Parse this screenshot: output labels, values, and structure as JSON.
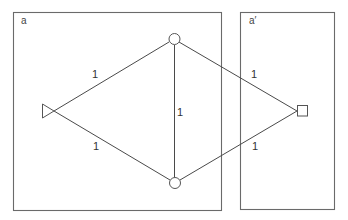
{
  "panels": [
    {
      "label": "a",
      "x": 13,
      "y": 12,
      "w": 208,
      "h": 198
    },
    {
      "label": "a′",
      "x": 240,
      "y": 12,
      "w": 94,
      "h": 198
    }
  ],
  "nodes": {
    "source": {
      "shape": "triangle",
      "x": 48,
      "y": 111
    },
    "top": {
      "shape": "circle",
      "x": 174,
      "y": 39
    },
    "bottom": {
      "shape": "circle",
      "x": 175,
      "y": 183
    },
    "sink": {
      "shape": "square",
      "x": 302,
      "y": 111
    }
  },
  "edges": [
    {
      "from": "source",
      "to": "top",
      "weight": "1"
    },
    {
      "from": "source",
      "to": "bottom",
      "weight": "1"
    },
    {
      "from": "top",
      "to": "bottom",
      "weight": "1"
    },
    {
      "from": "top",
      "to": "sink",
      "weight": "1"
    },
    {
      "from": "bottom",
      "to": "sink",
      "weight": "1"
    }
  ],
  "labels": {
    "panel_a": "a",
    "panel_a_prime": "a′",
    "edge_source_top": "1",
    "edge_source_bottom": "1",
    "edge_top_bottom": "1",
    "edge_top_sink": "1",
    "edge_bottom_sink": "1"
  }
}
